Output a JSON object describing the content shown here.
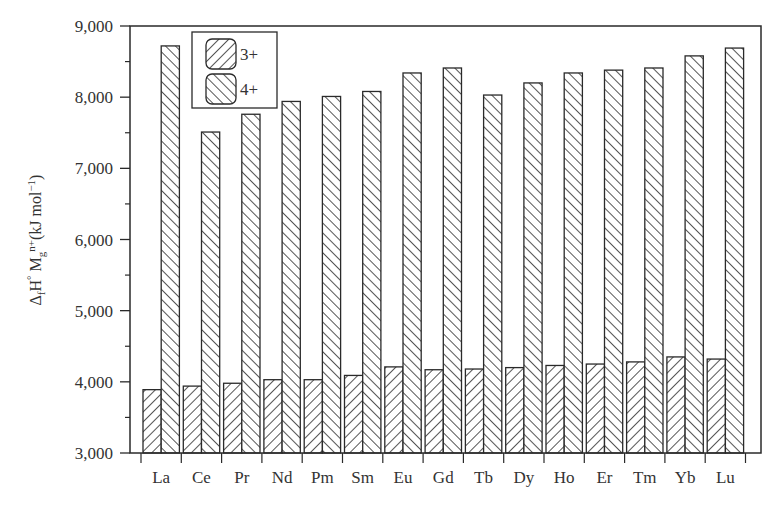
{
  "chart_data": {
    "type": "bar",
    "title": "",
    "xlabel": "",
    "ylabel": "ΔfH° Mg n+ (kJ mol−1)",
    "ylabel_parts": {
      "delta": "Δ",
      "f": "f",
      "H": "H",
      "deg": "°",
      "M": "M",
      "g": "g",
      "nplus": "n+",
      "units": "(kJ mol",
      "exp": "−1",
      "close": ")"
    },
    "ylim": [
      3000,
      9000
    ],
    "yticks": [
      3000,
      4000,
      5000,
      6000,
      7000,
      8000,
      9000
    ],
    "ytick_labels": [
      "3,000",
      "4,000",
      "5,000",
      "6,000",
      "7,000",
      "8,000",
      "9,000"
    ],
    "minor_yticks": [
      3500,
      4500,
      5500,
      6500,
      7500,
      8500
    ],
    "grid": false,
    "legend_position": "upper left (inside)",
    "categories": [
      "La",
      "Ce",
      "Pr",
      "Nd",
      "Pm",
      "Sm",
      "Eu",
      "Gd",
      "Tb",
      "Dy",
      "Ho",
      "Er",
      "Tm",
      "Yb",
      "Lu"
    ],
    "series": [
      {
        "name": "3+",
        "hatch": "backslash",
        "values": [
          3890,
          3940,
          3980,
          4030,
          4030,
          4090,
          4210,
          4170,
          4180,
          4200,
          4230,
          4250,
          4280,
          4350,
          4320
        ]
      },
      {
        "name": "4+",
        "hatch": "slash",
        "values": [
          8720,
          7510,
          7760,
          7940,
          8010,
          8080,
          8340,
          8410,
          8030,
          8200,
          8340,
          8380,
          8410,
          8580,
          8690
        ]
      }
    ],
    "colors": {
      "line": "#2a2a2a",
      "fill": "#ffffff"
    }
  }
}
